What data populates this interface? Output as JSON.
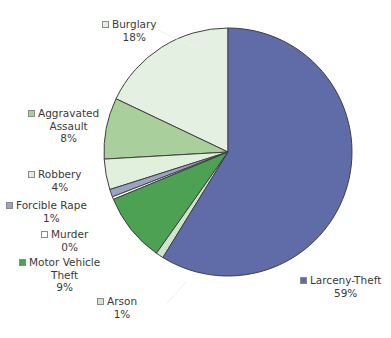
{
  "chart_data": {
    "type": "pie",
    "title": "",
    "legend_position": "around-slices",
    "start_angle_deg": 0,
    "direction": "counterclockwise",
    "units": "percent",
    "categories": [
      "Larceny-Theft",
      "Burglary",
      "Aggravated Assault",
      "Robbery",
      "Forcible Rape",
      "Murder",
      "Motor Vehicle Theft",
      "Arson"
    ],
    "values": [
      59,
      18,
      8,
      4,
      1,
      0,
      9,
      1
    ],
    "slices": [
      {
        "label": "Burglary",
        "percent_text": "18%",
        "value": 18,
        "color": "#e4f1e2"
      },
      {
        "label": "Aggravated Assault",
        "percent_text": "8%",
        "value": 8,
        "color": "#a9cf9c"
      },
      {
        "label": "Robbery",
        "percent_text": "4%",
        "value": 4,
        "color": "#e0f0dc"
      },
      {
        "label": "Forcible Rape",
        "percent_text": "1%",
        "value": 1,
        "color": "#9aa3c4"
      },
      {
        "label": "Murder",
        "percent_text": "0%",
        "value": 0.35,
        "color": "#ffffff"
      },
      {
        "label": "Motor Vehicle Theft",
        "percent_text": "9%",
        "value": 9,
        "color": "#4ca252"
      },
      {
        "label": "Arson",
        "percent_text": "1%",
        "value": 1,
        "color": "#cfe3cd"
      },
      {
        "label": "Larceny-Theft",
        "percent_text": "59%",
        "value": 59,
        "color": "#5f6ca8"
      }
    ],
    "colors": {
      "larceny_theft": "#5f6ca8",
      "burglary": "#e4f1e2",
      "aggravated_assault": "#a9cf9c",
      "robbery": "#e0f0dc",
      "forcible_rape": "#9aa3c4",
      "murder": "#ffffff",
      "motor_vehicle_theft": "#4ca252",
      "arson": "#cfe3cd",
      "slice_outline": "#3f3f3f",
      "text": "#3a3a3a",
      "background": "#ffffff"
    },
    "geometry": {
      "cx": 228,
      "cy": 152,
      "r": 124
    }
  },
  "labels": [
    {
      "name": "Burglary",
      "percent": "18%",
      "swatch": "#e4f1e2",
      "x": 102,
      "y": 18,
      "align": "left"
    },
    {
      "name": "Aggravated Assault",
      "percent": "8%",
      "swatch": "#a9cf9c",
      "x": 28,
      "y": 107,
      "align": "left"
    },
    {
      "name": "Robbery",
      "percent": "4%",
      "swatch": "#e0f0dc",
      "x": 28,
      "y": 168,
      "align": "left"
    },
    {
      "name": "Forcible Rape",
      "percent": "1%",
      "swatch": "#9aa3c4",
      "x": 6,
      "y": 199,
      "align": "left"
    },
    {
      "name": "Murder",
      "percent": "0%",
      "swatch": "#ffffff",
      "x": 41,
      "y": 228,
      "align": "left"
    },
    {
      "name": "Motor Vehicle Theft",
      "percent": "9%",
      "swatch": "#4ca252",
      "x": 19,
      "y": 256,
      "align": "left"
    },
    {
      "name": "Arson",
      "percent": "1%",
      "swatch": "#cfe3cd",
      "x": 97,
      "y": 295,
      "align": "left"
    },
    {
      "name": "Larceny-Theft",
      "percent": "59%",
      "swatch": "#5f6ca8",
      "x": 300,
      "y": 274,
      "align": "left"
    }
  ]
}
